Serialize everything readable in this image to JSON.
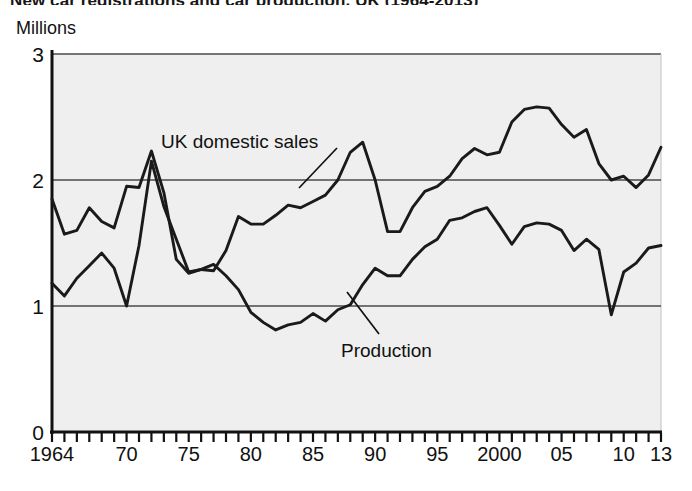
{
  "figure": {
    "title": "New car registrations and car production, UK (1964-2013)",
    "unit_label": "Millions"
  },
  "chart_data": {
    "type": "line",
    "title": "New car registrations and car production, UK (1964-2013)",
    "xlabel": "",
    "ylabel": "Millions",
    "ylim": [
      0,
      3
    ],
    "xlim": [
      1964,
      2013
    ],
    "yticks": [
      0,
      1,
      2,
      3
    ],
    "ytick_labels": [
      "0",
      "1",
      "2",
      "3"
    ],
    "grid": "horizontal-gridlines-at-1-and-2",
    "legend_position": "inline-annotations",
    "x_minor_tick_interval": 1,
    "xtick_values": [
      1964,
      1970,
      1975,
      1980,
      1985,
      1990,
      1995,
      2000,
      2005,
      2010,
      2013
    ],
    "xtick_labels": [
      "1964",
      "70",
      "75",
      "80",
      "85",
      "90",
      "95",
      "2000",
      "05",
      "10",
      "13"
    ],
    "x": [
      1964,
      1965,
      1966,
      1967,
      1968,
      1969,
      1970,
      1971,
      1972,
      1973,
      1974,
      1975,
      1976,
      1977,
      1978,
      1979,
      1980,
      1981,
      1982,
      1983,
      1984,
      1985,
      1986,
      1987,
      1988,
      1989,
      1990,
      1991,
      1992,
      1993,
      1994,
      1995,
      1996,
      1997,
      1998,
      1999,
      2000,
      2001,
      2002,
      2003,
      2004,
      2005,
      2006,
      2007,
      2008,
      2009,
      2010,
      2011,
      2012,
      2013
    ],
    "series": [
      {
        "name": "UK domestic sales",
        "color": "#1a1a1a",
        "values": [
          1.85,
          1.57,
          1.6,
          1.78,
          1.67,
          1.62,
          1.95,
          1.94,
          2.23,
          1.9,
          1.37,
          1.26,
          1.29,
          1.28,
          1.44,
          1.71,
          1.65,
          1.65,
          1.72,
          1.8,
          1.78,
          1.83,
          1.88,
          2.0,
          2.22,
          2.3,
          2.0,
          1.59,
          1.59,
          1.78,
          1.91,
          1.95,
          2.03,
          2.17,
          2.25,
          2.2,
          2.22,
          2.46,
          2.56,
          2.58,
          2.57,
          2.44,
          2.34,
          2.4,
          2.13,
          2.0,
          2.03,
          1.94,
          2.04,
          2.26
        ],
        "annotation": "UK domestic sales"
      },
      {
        "name": "Production",
        "color": "#1a1a1a",
        "values": [
          1.18,
          1.08,
          1.22,
          1.32,
          1.42,
          1.3,
          1.0,
          1.48,
          2.15,
          1.79,
          1.53,
          1.27,
          1.29,
          1.33,
          1.24,
          1.13,
          0.95,
          0.87,
          0.81,
          0.85,
          0.87,
          0.94,
          0.88,
          0.97,
          1.01,
          1.17,
          1.3,
          1.24,
          1.24,
          1.37,
          1.47,
          1.53,
          1.68,
          1.7,
          1.75,
          1.78,
          1.64,
          1.49,
          1.63,
          1.66,
          1.65,
          1.6,
          1.44,
          1.53,
          1.45,
          0.93,
          1.27,
          1.34,
          1.46,
          1.48
        ],
        "annotation": "Production"
      }
    ],
    "annotations": [
      {
        "text": "UK domestic sales",
        "x_px": 160,
        "y_px": 143
      },
      {
        "text": "Production",
        "x_px": 340,
        "y_px": 355
      }
    ]
  }
}
